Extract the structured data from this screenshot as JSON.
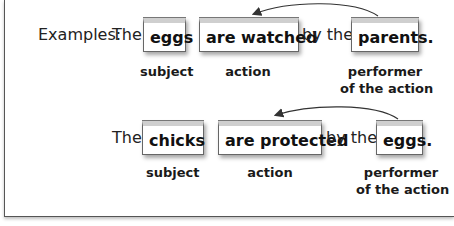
{
  "examples": {
    "prefix_label": "Examples:",
    "rows": [
      {
        "article": "The",
        "subject": "eggs",
        "action": "are watched",
        "connector": "by the",
        "performer": "parents.",
        "labels": {
          "subject": "subject",
          "action": "action",
          "performer_line1": "performer",
          "performer_line2": "of the action"
        }
      },
      {
        "article": "The",
        "subject": "chicks",
        "action": "are protected",
        "connector": "by the",
        "performer": "eggs.",
        "labels": {
          "subject": "subject",
          "action": "action",
          "performer_line1": "performer",
          "performer_line2": "of the action"
        }
      }
    ]
  },
  "colors": {
    "box_border": "#666666",
    "box_top_band": "#cfcfcf",
    "arrow": "#333333",
    "text": "#1a1a1a"
  }
}
